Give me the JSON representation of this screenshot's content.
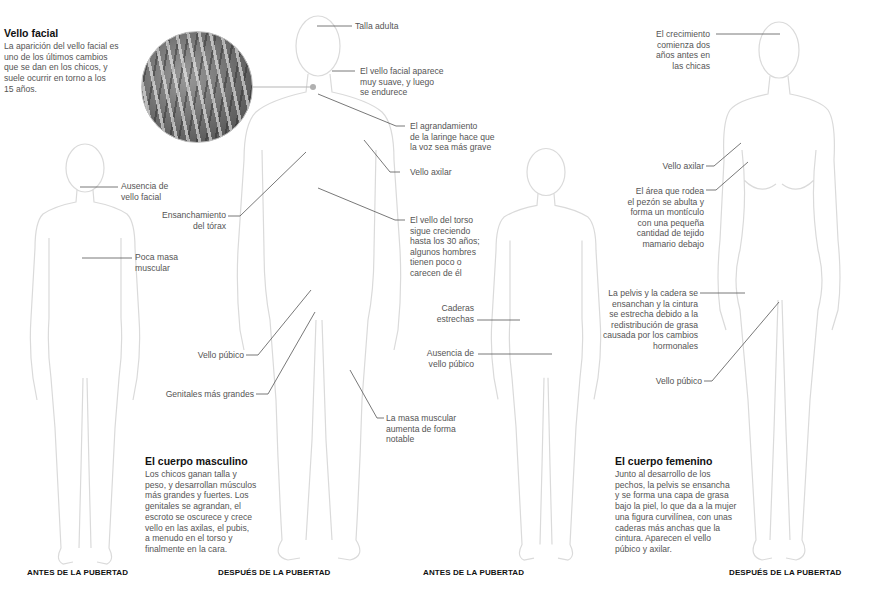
{
  "facial_hair_box": {
    "title": "Vello facial",
    "text": "La aparición del vello facial es\nuno de los últimos cambios\nque se dan en los chicos, y\nsuele ocurrir en torno a los\n15 años."
  },
  "boy_before": {
    "labels": [
      {
        "id": "no-facial-hair",
        "text": "Ausencia de\nvello facial"
      },
      {
        "id": "little-muscle",
        "text": "Poca masa\nmuscular"
      }
    ],
    "caption": "ANTES DE LA PUBERTAD"
  },
  "boy_after": {
    "labels": [
      {
        "id": "adult-height",
        "text": "Talla adulta"
      },
      {
        "id": "facial-hair",
        "text": "El vello facial aparece\nmuy suave, y luego\nse endurece"
      },
      {
        "id": "larynx",
        "text": "El agrandamiento\nde la laringe hace que\nla voz sea más grave"
      },
      {
        "id": "armpit-hair",
        "text": "Vello axilar"
      },
      {
        "id": "chest-widening",
        "text": "Ensanchamiento\ndel tórax"
      },
      {
        "id": "torso-hair",
        "text": "El vello del torso\nsigue creciendo\nhasta los 30 años;\nalgunos hombres\ntienen poco o\ncarecen de él"
      },
      {
        "id": "pubic-hair",
        "text": "Vello púbico"
      },
      {
        "id": "genitals",
        "text": "Genitales más grandes"
      },
      {
        "id": "muscle-mass",
        "text": "La masa muscular\naumenta de forma\nnotable"
      }
    ],
    "caption": "DESPUÉS DE LA PUBERTAD"
  },
  "male_body": {
    "title": "El cuerpo masculino",
    "text": "Los chicos ganan talla y\npeso, y desarrollan músculos\nmás grandes y fuertes. Los\ngenitales se agrandan, el\nescroto se oscurece y crece\nvello en las axilas, el pubis,\na menudo en el torso y\nfinalmente en la cara."
  },
  "girl_before": {
    "labels": [
      {
        "id": "narrow-hips",
        "text": "Caderas\nestrechas"
      },
      {
        "id": "no-pubic-hair",
        "text": "Ausencia de\nvello púbico"
      }
    ],
    "caption": "ANTES DE LA PUBERTAD"
  },
  "girl_after": {
    "labels": [
      {
        "id": "growth-earlier",
        "text": "El crecimiento\ncomienza dos\naños antes en\nlas chicas"
      },
      {
        "id": "armpit-hair",
        "text": "Vello axilar"
      },
      {
        "id": "breast",
        "text": "El área que rodea\nel pezón se abulta y\nforma un montículo\ncon una pequeña\ncantidad de tejido\nmamario debajo"
      },
      {
        "id": "pelvis",
        "text": "La pelvis y la cadera se\nensanchan y la cintura\nse estrecha debido a la\nredistribución de grasa\ncausada por los cambios\nhormonales"
      },
      {
        "id": "pubic-hair",
        "text": "Vello púbico"
      }
    ],
    "caption": "DESPUÉS DE LA PUBERTAD"
  },
  "female_body": {
    "title": "El cuerpo femenino",
    "text": "Junto al desarrollo de los\npechos, la pelvis se ensancha\ny se forma una capa de grasa\nbajo la piel, lo que da a la mujer\nuna figura curvilínea, con unas\ncaderas más anchas que la\ncintura. Aparecen el vello\npúbico y axilar."
  },
  "colors": {
    "leader_line": "#555555",
    "figure_outline": "#d8d8d8",
    "heading": "#111111",
    "body_text": "#555555"
  }
}
